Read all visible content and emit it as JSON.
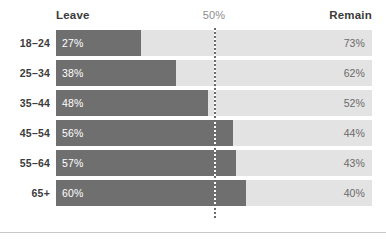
{
  "chart_data": {
    "type": "bar",
    "subtype": "stacked-horizontal-100pct",
    "title": "",
    "xlabel": "",
    "ylabel": "",
    "xlim": [
      0,
      100
    ],
    "grid": false,
    "legend_position": "top",
    "categories": [
      "18–24",
      "25–34",
      "35–44",
      "45–54",
      "55–64",
      "65+"
    ],
    "series": [
      {
        "name": "Leave",
        "values": [
          27,
          38,
          48,
          56,
          57,
          60
        ],
        "color": "#6f6f6f"
      },
      {
        "name": "Remain",
        "values": [
          73,
          62,
          52,
          44,
          43,
          40
        ],
        "color": "#e3e3e3"
      }
    ],
    "annotations": [
      {
        "label": "50%",
        "x": 50,
        "type": "reference-line",
        "style": "dotted"
      }
    ],
    "data_labels": {
      "leave": [
        "27%",
        "38%",
        "48%",
        "56%",
        "57%",
        "60%"
      ],
      "remain": [
        "73%",
        "62%",
        "52%",
        "44%",
        "43%",
        "40%"
      ]
    }
  },
  "header": {
    "left_label": "Leave",
    "mid_label": "50%",
    "right_label": "Remain"
  },
  "rows": [
    {
      "category": "18–24",
      "leave_label": "27%",
      "remain_label": "73%",
      "leave_pct": 27
    },
    {
      "category": "25–34",
      "leave_label": "38%",
      "remain_label": "62%",
      "leave_pct": 38
    },
    {
      "category": "35–44",
      "leave_label": "48%",
      "remain_label": "52%",
      "leave_pct": 48
    },
    {
      "category": "45–54",
      "leave_label": "56%",
      "remain_label": "44%",
      "leave_pct": 56
    },
    {
      "category": "55–64",
      "leave_label": "57%",
      "remain_label": "43%",
      "leave_pct": 57
    },
    {
      "category": "65+",
      "leave_label": "60%",
      "remain_label": "40%",
      "leave_pct": 60
    }
  ],
  "colors": {
    "leave_bar": "#6f6f6f",
    "remain_track": "#e3e3e3",
    "reference_line": "#6b6b6b",
    "label_text": "#3c3c3c",
    "remain_value_text": "#6a6a6a",
    "leave_value_text": "#ffffff",
    "divider": "#c9c9c9",
    "background": "#ffffff"
  }
}
